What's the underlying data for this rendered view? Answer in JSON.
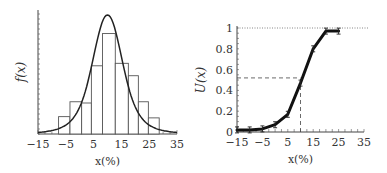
{
  "chart_data": [
    {
      "type": "bar",
      "subtype": "histogram-with-density-curve",
      "title": "",
      "xlabel": "x(%)",
      "ylabel": "f(x)",
      "xlim": [
        -15,
        35
      ],
      "xticks": [
        -15,
        -5,
        5,
        15,
        25,
        35
      ],
      "xtick_labels": [
        "−15",
        "−5",
        "5",
        "15",
        "25",
        "35"
      ],
      "yticks_labeled": false,
      "grid": false,
      "legend": null,
      "bins": [
        {
          "left": -7.6,
          "right": -3.5,
          "rel_height": 0.14
        },
        {
          "left": -3.5,
          "right": 0.7,
          "rel_height": 0.26
        },
        {
          "left": 0.7,
          "right": 4.2,
          "rel_height": 0.25
        },
        {
          "left": 4.2,
          "right": 8.2,
          "rel_height": 0.55
        },
        {
          "left": 8.2,
          "right": 12.8,
          "rel_height": 0.81
        },
        {
          "left": 12.8,
          "right": 17.5,
          "rel_height": 0.57
        },
        {
          "left": 17.5,
          "right": 21.1,
          "rel_height": 0.47
        },
        {
          "left": 21.1,
          "right": 24.7,
          "rel_height": 0.26
        },
        {
          "left": 24.7,
          "right": 28.6,
          "rel_height": 0.13
        }
      ],
      "curve": {
        "shape": "bell",
        "peak_x": 10,
        "peak_rel_height": 0.96,
        "tail_rel_height_at_xlim": 0.06
      }
    },
    {
      "type": "line",
      "title": "",
      "xlabel": "x(%)",
      "ylabel": "U(x)",
      "xlim": [
        -15,
        35
      ],
      "ylim": [
        0,
        1
      ],
      "xticks": [
        -15,
        -5,
        5,
        15,
        25,
        35
      ],
      "xtick_labels": [
        "−15",
        "−5",
        "5",
        "15",
        "25",
        "35"
      ],
      "yticks": [
        0,
        0.2,
        0.4,
        0.6,
        0.8,
        1
      ],
      "ytick_labels": [
        "0",
        "0.2",
        "0.4",
        "0.6",
        "0.8",
        "1"
      ],
      "grid": false,
      "legend": null,
      "series": [
        {
          "name": "U(x)",
          "x": [
            -15,
            -10,
            -5,
            0,
            5,
            10,
            15,
            20,
            25
          ],
          "y": [
            0.02,
            0.02,
            0.03,
            0.07,
            0.17,
            0.47,
            0.8,
            0.97,
            0.97
          ],
          "marker": "error-bar"
        }
      ],
      "annotations": [
        {
          "type": "hline-dotted",
          "y": 1
        },
        {
          "type": "hline-dashed",
          "y": 0.52,
          "x_from": -15,
          "x_to": 10
        },
        {
          "type": "vline-dashed",
          "x": 10,
          "y_from": 0,
          "y_to": 0.52
        }
      ]
    }
  ]
}
